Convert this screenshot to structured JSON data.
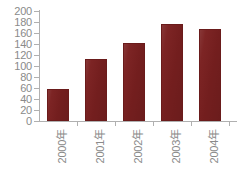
{
  "chart_data": {
    "type": "bar",
    "title": "",
    "subtitle": "",
    "xlabel": "",
    "ylabel": "",
    "categories": [
      "2000年",
      "2001年",
      "2002年",
      "2003年",
      "2004年"
    ],
    "values": [
      58,
      112,
      142,
      176,
      167
    ],
    "ylim": [
      0,
      200
    ],
    "ytick_step": 20,
    "yticks": [
      200,
      180,
      160,
      140,
      120,
      100,
      80,
      60,
      40,
      20,
      0
    ],
    "ytick_labels": [
      "200",
      "180",
      "160",
      "140",
      "120",
      "100",
      "80",
      "60",
      "40",
      "20",
      "0"
    ],
    "grid": false,
    "legend": null,
    "legend_position": "none",
    "series": [
      {
        "name": "",
        "values": [
          58,
          112,
          142,
          176,
          167
        ]
      }
    ],
    "colors": {
      "bar_fill": "#7a2020",
      "bar_border": "#6a1b1b",
      "axis": "#b0b0b0",
      "tick_text": "#8a8a8a",
      "background": "#ffffff"
    },
    "xlabel_rotation": -90
  }
}
